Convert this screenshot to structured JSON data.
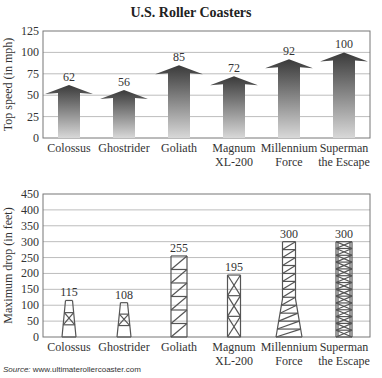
{
  "title": "U.S. Roller Coasters",
  "source_label": "Source:",
  "source_url": "www.ultimaterollercoaster.com",
  "chart_data": [
    {
      "type": "bar",
      "title": "U.S. Roller Coasters",
      "xlabel": "",
      "ylabel": "Top speed (in mph)",
      "ylim": [
        0,
        125
      ],
      "yticks": [
        0,
        25,
        50,
        75,
        100,
        125
      ],
      "grid": true,
      "categories": [
        "Colossus",
        "Ghostrider",
        "Goliath",
        "Magnum XL-200",
        "Millennium Force",
        "Superman the Escape"
      ],
      "category_lines": [
        [
          "Colossus"
        ],
        [
          "Ghostrider"
        ],
        [
          "Goliath"
        ],
        [
          "Magnum",
          "XL-200"
        ],
        [
          "Millennium",
          "Force"
        ],
        [
          "Superman",
          "the Escape"
        ]
      ],
      "values": [
        62,
        56,
        85,
        72,
        92,
        100
      ],
      "bar_style": "upward-arrow"
    },
    {
      "type": "bar",
      "title": "",
      "xlabel": "",
      "ylabel": "Maximum drop (in feet)",
      "ylim": [
        0,
        450
      ],
      "yticks": [
        0,
        50,
        100,
        150,
        200,
        250,
        300,
        350,
        400,
        450
      ],
      "grid": true,
      "categories": [
        "Colossus",
        "Ghostrider",
        "Goliath",
        "Magnum XL-200",
        "Millennium Force",
        "Superman the Escape"
      ],
      "category_lines": [
        [
          "Colossus"
        ],
        [
          "Ghostrider"
        ],
        [
          "Goliath"
        ],
        [
          "Magnum",
          "XL-200"
        ],
        [
          "Millennium",
          "Force"
        ],
        [
          "Superman",
          "the Escape"
        ]
      ],
      "values": [
        115,
        108,
        255,
        195,
        300,
        300
      ],
      "bar_style": "lattice-tower"
    }
  ],
  "colors": {
    "arrow_top": "#3a3a3a",
    "arrow_bottom": "#d8d8d8",
    "tower": "#555555",
    "grid": "#bdbdbd",
    "frame": "#777777"
  }
}
